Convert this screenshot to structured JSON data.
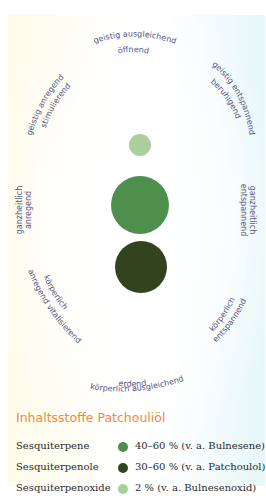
{
  "diagram": {
    "labels": {
      "top": [
        "geistig ausgleichend",
        "öffnend"
      ],
      "top_left": [
        "geistig anregend",
        "stimulierend"
      ],
      "top_right": [
        "geistig entspannend",
        "beruhigend"
      ],
      "left": [
        "ganzheitlich",
        "anregend"
      ],
      "right": [
        "ganzheitlich",
        "entspannend"
      ],
      "bottom_left": [
        "körperlich",
        "anregend vitalisierend"
      ],
      "bottom_right": [
        "körperlich",
        "entspannend"
      ],
      "bottom": [
        "erdend",
        "körperlich ausgleichend"
      ]
    },
    "circles": [
      {
        "name": "small-light-green-circle",
        "cx": 140,
        "cy": 145,
        "r": 11,
        "color": "#a9d09a"
      },
      {
        "name": "medium-green-circle",
        "cx": 140,
        "cy": 205,
        "r": 29,
        "color": "#4e8f4d"
      },
      {
        "name": "dark-green-circle",
        "cx": 141,
        "cy": 267,
        "r": 26,
        "color": "#33421f"
      }
    ]
  },
  "ingredients": {
    "title": "Inhaltsstoffe Patchouliöl",
    "rows": [
      {
        "name": "Sesquiterpene",
        "value": "40–60 % (v. a. Bulnesene)",
        "color": "#4e8f4d"
      },
      {
        "name": "Sesquiterpenole",
        "value": "30–60 % (v. a. Patchoulol)",
        "color": "#33421f"
      },
      {
        "name": "Sesquiterpenoxide",
        "value": "2 % (v. a. Bulnesenoxid)",
        "color": "#a9d09a"
      }
    ]
  },
  "colors": {
    "label_text": "#55537e",
    "title_orange": "#f08a3c"
  }
}
